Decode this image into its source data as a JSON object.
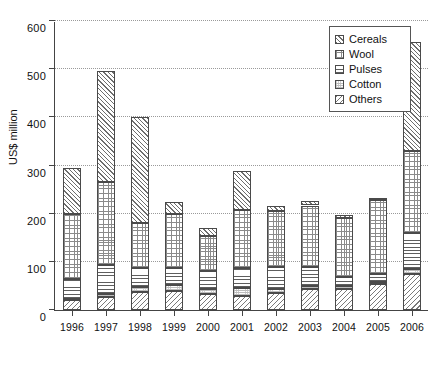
{
  "chart_data": {
    "type": "bar",
    "subtype": "stacked-vertical",
    "title": "",
    "xlabel": "",
    "ylabel": "US$ million",
    "ylim": [
      0,
      600
    ],
    "ytick_step": 100,
    "yticks": [
      0,
      100,
      200,
      300,
      400,
      500,
      600
    ],
    "ytick_labels": [
      "0",
      "100",
      "200",
      "300",
      "400",
      "500",
      "600"
    ],
    "grid": "horizontal-dotted",
    "legend_position": "top-right",
    "categories": [
      "1996",
      "1997",
      "1998",
      "1999",
      "2000",
      "2001",
      "2002",
      "2003",
      "2004",
      "2005",
      "2006"
    ],
    "series": [
      {
        "name": "Others",
        "pattern": "diagonal-backslash",
        "values": [
          20,
          28,
          38,
          40,
          33,
          30,
          36,
          43,
          44,
          54,
          75
        ]
      },
      {
        "name": "Cotton",
        "pattern": "light-stipple",
        "values": [
          2,
          6,
          10,
          12,
          11,
          16,
          8,
          6,
          5,
          4,
          10
        ]
      },
      {
        "name": "Pulses",
        "pattern": "horizontal-lines",
        "values": [
          43,
          60,
          40,
          35,
          37,
          42,
          45,
          40,
          20,
          16,
          75
        ]
      },
      {
        "name": "Wool",
        "pattern": "fine-grid",
        "values": [
          135,
          172,
          92,
          112,
          73,
          120,
          116,
          128,
          122,
          155,
          170
        ]
      },
      {
        "name": "Cereals",
        "pattern": "diagonal-slash",
        "values": [
          95,
          230,
          220,
          25,
          16,
          81,
          10,
          10,
          6,
          4,
          227
        ]
      }
    ],
    "totals": [
      295,
      496,
      400,
      224,
      170,
      289,
      215,
      227,
      197,
      233,
      557
    ],
    "bar_count": 11,
    "series_count": 5
  },
  "legend": {
    "items": [
      {
        "label": "Cereals",
        "swatch": "diagonal-slash-swatch"
      },
      {
        "label": "Wool",
        "swatch": "fine-grid-swatch"
      },
      {
        "label": "Pulses",
        "swatch": "horizontal-lines-swatch"
      },
      {
        "label": "Cotton",
        "swatch": "light-stipple-swatch"
      },
      {
        "label": "Others",
        "swatch": "diagonal-backslash-swatch"
      }
    ]
  },
  "axes": {
    "y_title": "US$ million"
  },
  "caption": ""
}
